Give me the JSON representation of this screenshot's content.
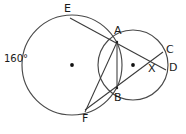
{
  "figure": {
    "type": "geometry-diagram",
    "width": 186,
    "height": 134,
    "background_color": "#ffffff",
    "stroke_color": "#3a3a3a"
  },
  "annotations": {
    "arc_measure": "160°"
  },
  "points": [
    {
      "id": "E",
      "label": "E",
      "x": 70,
      "y": 18,
      "on": "large-circle"
    },
    {
      "id": "A",
      "label": "A",
      "x": 117,
      "y": 42,
      "on": "circle-intersection-upper"
    },
    {
      "id": "C",
      "label": "C",
      "x": 163,
      "y": 52,
      "on": "small-circle"
    },
    {
      "id": "D",
      "label": "D",
      "x": 166,
      "y": 70,
      "on": "small-circle"
    },
    {
      "id": "X",
      "label": "X",
      "x": 151,
      "y": 61,
      "on": "chord-intersection"
    },
    {
      "id": "B",
      "label": "B",
      "x": 117,
      "y": 88,
      "on": "circle-intersection-lower"
    },
    {
      "id": "F",
      "label": "F",
      "x": 85,
      "y": 110,
      "on": "large-circle"
    }
  ],
  "circles": [
    {
      "id": "large-circle",
      "name": "large-circle",
      "cx": 72,
      "cy": 65,
      "r": 50,
      "center_marked": true
    },
    {
      "id": "small-circle",
      "name": "small-circle",
      "cx": 133,
      "cy": 65,
      "r": 35,
      "center_marked": true
    }
  ],
  "segments": [
    {
      "id": "E-D",
      "name": "secant-E-to-D",
      "from": "E",
      "to": "D",
      "through": [
        "A",
        "X"
      ]
    },
    {
      "id": "F-C",
      "name": "secant-F-to-C",
      "from": "F",
      "to": "C",
      "through": [
        "B",
        "X"
      ]
    },
    {
      "id": "A-B",
      "name": "chord-A-to-B",
      "from": "A",
      "to": "B",
      "through": []
    }
  ]
}
